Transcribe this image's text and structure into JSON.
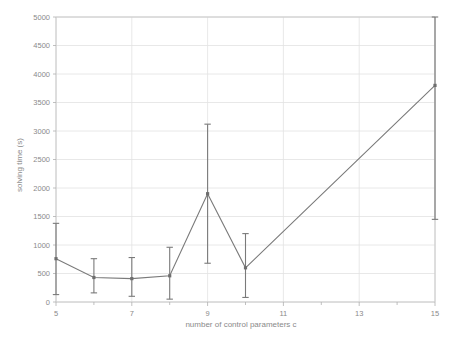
{
  "chart_data": {
    "type": "line",
    "title": "",
    "xlabel": "number of control parameters c",
    "ylabel": "solving time (s)",
    "xlim": [
      5,
      15
    ],
    "ylim": [
      0,
      5000
    ],
    "grid": true,
    "legend": "none",
    "x_major_ticks": [
      5,
      7,
      9,
      11,
      13,
      15
    ],
    "x_major_tick_labels": [
      "5",
      "7",
      "9",
      "11",
      "13",
      "15"
    ],
    "x_minor_ticks": [
      6,
      8,
      10,
      12,
      14
    ],
    "y_ticks": [
      0,
      500,
      1000,
      1500,
      2000,
      2500,
      3000,
      3500,
      4000,
      4500,
      5000
    ],
    "y_tick_labels": [
      "0",
      "500",
      "1000",
      "1500",
      "2000",
      "2500",
      "3000",
      "3500",
      "4000",
      "4500",
      "5000"
    ],
    "x": [
      5,
      6,
      7,
      8,
      9,
      10,
      15
    ],
    "values": [
      760,
      430,
      410,
      460,
      1900,
      600,
      3800
    ],
    "error_low": [
      130,
      160,
      100,
      50,
      680,
      80,
      1450
    ],
    "error_high": [
      1380,
      760,
      780,
      960,
      3120,
      1200,
      5000
    ],
    "series": [
      {
        "name": "solving time",
        "values": [
          760,
          430,
          410,
          460,
          1900,
          600,
          3800
        ],
        "error_low": [
          130,
          160,
          100,
          50,
          680,
          80,
          1450
        ],
        "error_high": [
          1380,
          760,
          780,
          960,
          3120,
          1200,
          5000
        ],
        "color": "#7a7a7a"
      }
    ]
  },
  "style": {
    "line_color": "#7a7a7a",
    "grid_color": "#e2e2e2",
    "frame_color": "#c8c8c8",
    "text_color": "#8a8a8a",
    "background": "#ffffff"
  }
}
